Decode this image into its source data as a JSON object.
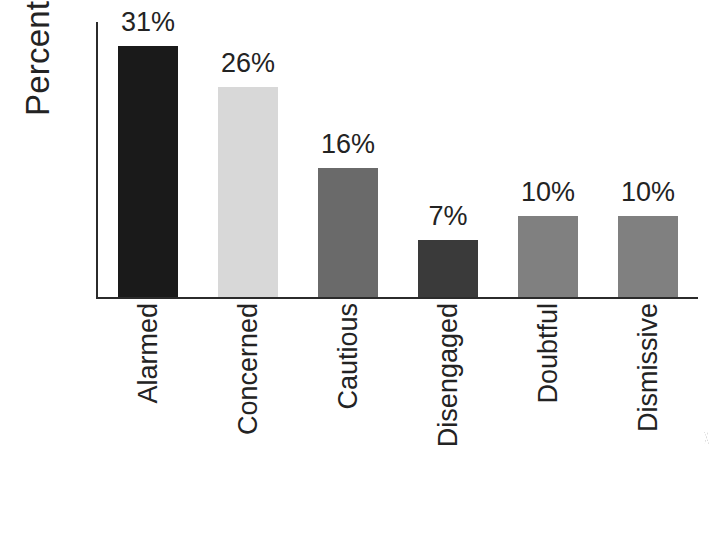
{
  "chart_data": {
    "type": "bar",
    "title": "",
    "xlabel": "",
    "ylabel": "Percental",
    "ylim": [
      0,
      34
    ],
    "grid": false,
    "legend": "none",
    "value_label_suffix": "%",
    "categories": [
      "Alarmed",
      "Concerned",
      "Cautious",
      "Disengaged",
      "Doubtful",
      "Dismissive"
    ],
    "values": [
      31,
      26,
      16,
      7,
      10,
      10
    ],
    "value_labels": [
      "31%",
      "26%",
      "16%",
      "7%",
      "10%",
      "10%"
    ],
    "bar_colors": [
      "#1a1a1a",
      "#d8d8d8",
      "#6a6a6a",
      "#3a3a3a",
      "#808080",
      "#808080"
    ],
    "axis_color": "#2b2b2b",
    "background_color": "#ffffff",
    "text_color": "#232323",
    "bars": [
      {
        "category": "Alarmed",
        "value": 31,
        "label": "31%",
        "color": "#1a1a1a"
      },
      {
        "category": "Concerned",
        "value": 26,
        "label": "26%",
        "color": "#d8d8d8"
      },
      {
        "category": "Cautious",
        "value": 16,
        "label": "16%",
        "color": "#6a6a6a"
      },
      {
        "category": "Disengaged",
        "value": 7,
        "label": "7%",
        "color": "#3a3a3a"
      },
      {
        "category": "Doubtful",
        "value": 10,
        "label": "10%",
        "color": "#808080"
      },
      {
        "category": "Dismissive",
        "value": 10,
        "label": "10%",
        "color": "#808080"
      }
    ]
  },
  "axis": {
    "y_title": "Percental"
  }
}
